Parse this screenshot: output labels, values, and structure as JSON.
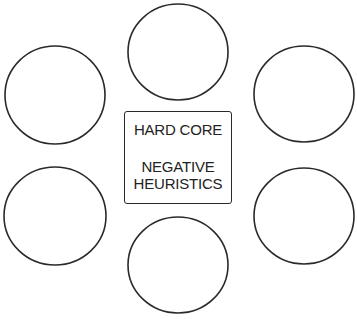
{
  "diagram": {
    "center_box": {
      "title": "HARD CORE",
      "subtitle_line1": "NEGATIVE",
      "subtitle_line2": "HEURISTICS"
    },
    "circles": [
      {
        "id": "top",
        "cx": 178,
        "cy": 52,
        "r": 50,
        "label": ""
      },
      {
        "id": "top-left",
        "cx": 55,
        "cy": 95,
        "r": 50,
        "label": ""
      },
      {
        "id": "top-right",
        "cx": 304,
        "cy": 94,
        "r": 50,
        "label": ""
      },
      {
        "id": "bottom-left",
        "cx": 55,
        "cy": 216,
        "r": 50,
        "label": ""
      },
      {
        "id": "bottom-right",
        "cx": 304,
        "cy": 216,
        "r": 49,
        "label": ""
      },
      {
        "id": "bottom",
        "cx": 178,
        "cy": 265,
        "r": 49,
        "label": ""
      }
    ],
    "stroke_color": "#2a2a2a"
  }
}
